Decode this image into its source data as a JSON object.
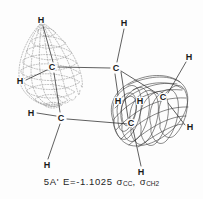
{
  "figure": {
    "title_absent": "",
    "caption": {
      "state_label": "5A'",
      "energy_text": "E=-1.1025",
      "energy_value": -1.1025,
      "orbital_1": "σ",
      "orbital_1_sub": "CC",
      "separator": ",",
      "orbital_2": "σ",
      "orbital_2_sub": "CH",
      "orbital_2_sub_num": "2",
      "full_text": "5A' E=-1.1025 σCC, σCH2"
    },
    "colors": {
      "background": "#fdfdfd",
      "ink": "#1a1a1a",
      "mesh_solid": "#3a3a3a",
      "mesh_dashed": "#8a8a8a",
      "bond": "#2b2b2b",
      "caption": "#262626"
    }
  },
  "lobes": [
    {
      "name": "negative-phase-lobe",
      "style": "dashed-mesh",
      "shape": "teardrop",
      "center_x": 55,
      "center_y": 68,
      "description": "dotted teardrop isosurface around left carbon"
    },
    {
      "name": "positive-phase-lobe",
      "style": "solid-mesh",
      "shape": "cylinder-torus",
      "center_x": 148,
      "center_y": 110,
      "description": "solid line cylindrical isosurface around right carbons"
    }
  ],
  "atoms": [
    {
      "label": "H",
      "x": 41,
      "y": 20,
      "name": "atom-h-top-left"
    },
    {
      "label": "H",
      "x": 124,
      "y": 23,
      "name": "atom-h-top-center"
    },
    {
      "label": "H",
      "x": 189,
      "y": 57,
      "name": "atom-h-top-right"
    },
    {
      "label": "C",
      "x": 52,
      "y": 67,
      "name": "atom-c-left"
    },
    {
      "label": "C",
      "x": 116,
      "y": 68,
      "name": "atom-c-center"
    },
    {
      "label": "H",
      "x": 20,
      "y": 81,
      "name": "atom-h-far-left"
    },
    {
      "label": "C",
      "x": 163,
      "y": 97,
      "name": "atom-c-right-upper"
    },
    {
      "label": "H",
      "x": 140,
      "y": 101,
      "name": "atom-h-inner-right"
    },
    {
      "label": "H",
      "x": 118,
      "y": 101,
      "name": "atom-h-mid-lower"
    },
    {
      "label": "C",
      "x": 131,
      "y": 123,
      "name": "atom-c-right-lower"
    },
    {
      "label": "H",
      "x": 31,
      "y": 113,
      "name": "atom-h-lower-left"
    },
    {
      "label": "C",
      "x": 61,
      "y": 118,
      "name": "atom-c-lower"
    },
    {
      "label": "H",
      "x": 190,
      "y": 127,
      "name": "atom-h-far-right"
    },
    {
      "label": "H",
      "x": 47,
      "y": 165,
      "name": "atom-h-bottom-left"
    },
    {
      "label": "H",
      "x": 141,
      "y": 172,
      "name": "atom-h-bottom-right"
    }
  ],
  "bonds": [
    {
      "name": "bond-c-left-to-h-top",
      "x1": 53,
      "y1": 62,
      "x2": 43,
      "y2": 26
    },
    {
      "name": "bond-c-left-to-h-far-left",
      "x1": 47,
      "y1": 70,
      "x2": 26,
      "y2": 80
    },
    {
      "name": "bond-c-left-to-c-center",
      "x1": 58,
      "y1": 67,
      "x2": 110,
      "y2": 68
    },
    {
      "name": "bond-c-left-to-c-lower",
      "x1": 54,
      "y1": 73,
      "x2": 60,
      "y2": 112
    },
    {
      "name": "bond-c-center-to-h-top",
      "x1": 117,
      "y1": 62,
      "x2": 124,
      "y2": 29
    },
    {
      "name": "bond-c-center-to-h-lower",
      "x1": 115,
      "y1": 74,
      "x2": 118,
      "y2": 95
    },
    {
      "name": "bond-c-center-to-c-right",
      "x1": 121,
      "y1": 71,
      "x2": 158,
      "y2": 94
    },
    {
      "name": "bond-c-center-to-c-rlower",
      "x1": 121,
      "y1": 72,
      "x2": 128,
      "y2": 118
    },
    {
      "name": "bond-c-lower-to-h-left",
      "x1": 56,
      "y1": 116,
      "x2": 37,
      "y2": 113
    },
    {
      "name": "bond-c-lower-to-h-bottom",
      "x1": 60,
      "y1": 124,
      "x2": 48,
      "y2": 159
    },
    {
      "name": "bond-c-lower-to-right",
      "x1": 67,
      "y1": 119,
      "x2": 128,
      "y2": 124
    },
    {
      "name": "bond-c-right-to-h-topright",
      "x1": 168,
      "y1": 93,
      "x2": 186,
      "y2": 62
    },
    {
      "name": "bond-c-right-to-h-far",
      "x1": 168,
      "y1": 103,
      "x2": 185,
      "y2": 125
    },
    {
      "name": "bond-c-rlower-to-h-bottom",
      "x1": 133,
      "y1": 129,
      "x2": 141,
      "y2": 166
    }
  ]
}
